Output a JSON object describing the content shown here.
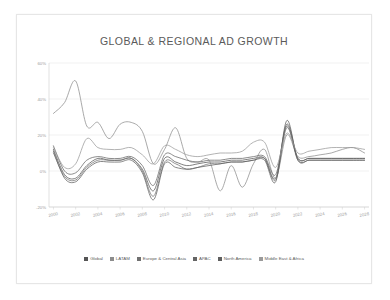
{
  "chart_data": {
    "type": "line",
    "title": "GLOBAL & REGIONAL AD GROWTH",
    "xlabel": "",
    "ylabel": "",
    "xlim": [
      1999.6,
      2028.4
    ],
    "ylim": [
      -20,
      60
    ],
    "grid": true,
    "legend_position": "bottom",
    "x_ticks": [
      "2000",
      "2002",
      "2004",
      "2006",
      "2008",
      "2010",
      "2012",
      "2014",
      "2016",
      "2018",
      "2020",
      "2022",
      "2024",
      "2026",
      "2028"
    ],
    "x_tick_values": [
      2000,
      2002,
      2004,
      2006,
      2008,
      2010,
      2012,
      2014,
      2016,
      2018,
      2020,
      2022,
      2024,
      2026,
      2028
    ],
    "y_ticks": [
      "-20%",
      "0%",
      "20%",
      "40%",
      "60%"
    ],
    "y_tick_values": [
      -20,
      0,
      20,
      40,
      60
    ],
    "x": [
      2000,
      2001,
      2002,
      2003,
      2004,
      2005,
      2006,
      2007,
      2008,
      2009,
      2010,
      2011,
      2012,
      2013,
      2014,
      2015,
      2016,
      2017,
      2018,
      2019,
      2020,
      2021,
      2022,
      2023,
      2024,
      2025,
      2026,
      2027,
      2028
    ],
    "series": [
      {
        "name": "Global",
        "color": "#555555",
        "values": [
          12,
          -2,
          -4,
          3,
          7,
          6,
          6,
          7,
          1,
          -11,
          7,
          5,
          3,
          4,
          5,
          5,
          6,
          6,
          7,
          7,
          -4,
          26,
          7,
          7,
          7,
          7,
          7,
          7,
          7
        ]
      },
      {
        "name": "LATAM",
        "color": "#8c8c8c",
        "values": [
          32,
          38,
          50,
          25,
          27,
          18,
          26,
          27,
          22,
          4,
          12,
          24,
          7,
          5,
          6,
          -11,
          3,
          -9,
          4,
          12,
          -4,
          20,
          8,
          8,
          9,
          10,
          12,
          13,
          10
        ]
      },
      {
        "name": "Europe & Central Asia",
        "color": "#707070",
        "values": [
          10,
          -3,
          -5,
          2,
          6,
          6,
          6,
          7,
          0,
          -14,
          5,
          4,
          1,
          2,
          4,
          4,
          5,
          5,
          6,
          7,
          -5,
          24,
          6,
          6,
          6,
          6,
          6,
          6,
          6
        ]
      },
      {
        "name": "APAC",
        "color": "#656565",
        "values": [
          14,
          0,
          -1,
          6,
          8,
          7,
          7,
          8,
          3,
          -8,
          9,
          8,
          6,
          5,
          6,
          6,
          7,
          7,
          8,
          8,
          -2,
          25,
          7,
          7,
          7,
          7,
          7,
          7,
          7
        ]
      },
      {
        "name": "North America",
        "color": "#5f5f5f",
        "values": [
          11,
          -4,
          -6,
          1,
          5,
          5,
          5,
          6,
          -1,
          -16,
          4,
          2,
          1,
          2,
          3,
          4,
          5,
          5,
          6,
          6,
          -6,
          28,
          6,
          6,
          6,
          6,
          6,
          6,
          6
        ]
      },
      {
        "name": "Middle East & Africa",
        "color": "#9a9a9a",
        "values": [
          13,
          2,
          4,
          18,
          13,
          12,
          12,
          13,
          9,
          4,
          14,
          12,
          9,
          8,
          9,
          10,
          10,
          11,
          16,
          16,
          2,
          21,
          10,
          11,
          12,
          13,
          13,
          13,
          12
        ]
      }
    ]
  },
  "legend": {
    "items": [
      {
        "label": "Global"
      },
      {
        "label": "LATAM"
      },
      {
        "label": "Europe & Central Asia"
      },
      {
        "label": "APAC"
      },
      {
        "label": "North America"
      },
      {
        "label": "Middle East & Africa"
      }
    ]
  }
}
